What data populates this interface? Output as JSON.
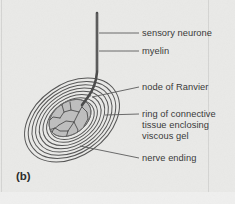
{
  "figure": {
    "panel_id": "(b)",
    "background_color": "#e9e9e7",
    "ink_color": "#3a3a3a",
    "width": 235,
    "height": 204
  },
  "labels": [
    {
      "id": "sensory-neurone",
      "text": "sensory neurone",
      "x": 142,
      "y": 29,
      "leader": {
        "x1": 99,
        "y1": 33,
        "x2": 139,
        "y2": 33
      }
    },
    {
      "id": "myelin",
      "text": "myelin",
      "x": 142,
      "y": 47,
      "leader": {
        "x1": 99,
        "y1": 51,
        "x2": 139,
        "y2": 51
      }
    },
    {
      "id": "node-of-ranvier",
      "text": "node of Ranvier",
      "x": 142,
      "y": 83,
      "leader": {
        "x1": 92,
        "y1": 97,
        "x2": 139,
        "y2": 87
      }
    },
    {
      "id": "ring-of-connective-tissue",
      "text": "ring of connective\ntissue enclosing\nviscous gel",
      "x": 142,
      "y": 110,
      "leader": {
        "x1": 105,
        "y1": 115,
        "x2": 139,
        "y2": 114
      }
    },
    {
      "id": "nerve-ending",
      "text": "nerve ending",
      "x": 142,
      "y": 154,
      "leader": {
        "x1": 80,
        "y1": 146,
        "x2": 139,
        "y2": 158
      }
    }
  ],
  "structure": {
    "axon": {
      "name": "sensory-neurone-axon",
      "top_x": 97,
      "top_y": 13,
      "bottom_x": 80,
      "bottom_y": 112,
      "stroke": "#4a4a4a"
    },
    "lamellae": {
      "name": "connective-tissue-lamellae",
      "count": 9,
      "center_x": 72,
      "center_y": 120,
      "rotation_deg": -35,
      "outer_rx": 52,
      "outer_ry": 36,
      "stroke": "#5a5a5a"
    },
    "core": {
      "name": "viscous-gel-core",
      "center_x": 70,
      "center_y": 118,
      "rx": 22,
      "ry": 15,
      "fill": "#bdbdbd"
    },
    "nerve_ending_fibres": {
      "name": "branching-nerve-endings",
      "stroke": "#4a4a4a",
      "branch_count": 14
    }
  },
  "frame": {
    "right_edge_x": 208,
    "bottom_edge_y": 192,
    "stroke": "#d2d2d0"
  }
}
